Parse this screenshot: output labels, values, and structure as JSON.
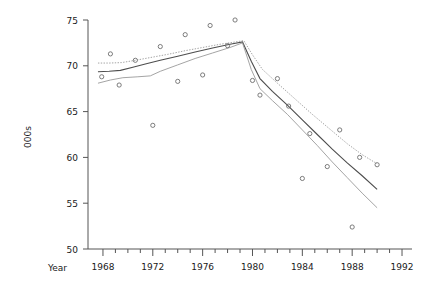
{
  "chart_data": {
    "type": "scatter",
    "title": "",
    "xlabel": "Year",
    "ylabel": "000s",
    "xlim": [
      1966.8,
      1992.8
    ],
    "ylim": [
      50,
      75
    ],
    "grid": false,
    "legend": "none",
    "x_ticks_major": [
      1968,
      1972,
      1976,
      1980,
      1984,
      1988,
      1992
    ],
    "x_tick_labels": [
      "1968",
      "1972",
      "1976",
      "1980",
      "1984",
      "1988",
      "1992"
    ],
    "x_ticks_minor": [
      1969,
      1970,
      1971,
      1973,
      1974,
      1975,
      1977,
      1978,
      1979,
      1981,
      1982,
      1983,
      1985,
      1986,
      1987,
      1989,
      1990,
      1991
    ],
    "y_ticks": [
      50,
      55,
      60,
      65,
      70,
      75
    ],
    "y_tick_labels": [
      "50",
      "55",
      "60",
      "65",
      "70",
      "75"
    ],
    "points": [
      {
        "x": 1967.9,
        "y": 68.8
      },
      {
        "x": 1968.6,
        "y": 71.3
      },
      {
        "x": 1969.3,
        "y": 67.9
      },
      {
        "x": 1970.6,
        "y": 70.6
      },
      {
        "x": 1972.0,
        "y": 63.5
      },
      {
        "x": 1972.6,
        "y": 72.1
      },
      {
        "x": 1974.0,
        "y": 68.3
      },
      {
        "x": 1974.6,
        "y": 73.4
      },
      {
        "x": 1976.0,
        "y": 69.0
      },
      {
        "x": 1976.6,
        "y": 74.4
      },
      {
        "x": 1978.0,
        "y": 72.2
      },
      {
        "x": 1978.6,
        "y": 75.0
      },
      {
        "x": 1980.0,
        "y": 68.4
      },
      {
        "x": 1980.6,
        "y": 66.8
      },
      {
        "x": 1982.0,
        "y": 68.6
      },
      {
        "x": 1982.9,
        "y": 65.6
      },
      {
        "x": 1984.0,
        "y": 57.7
      },
      {
        "x": 1984.6,
        "y": 62.6
      },
      {
        "x": 1986.0,
        "y": 59.0
      },
      {
        "x": 1987.0,
        "y": 63.0
      },
      {
        "x": 1988.0,
        "y": 52.4
      },
      {
        "x": 1988.6,
        "y": 60.0
      },
      {
        "x": 1990.0,
        "y": 59.2
      }
    ],
    "series": [
      {
        "name": "fit",
        "style": "solid-dark",
        "points": [
          {
            "x": 1967.6,
            "y": 69.35
          },
          {
            "x": 1968.5,
            "y": 69.4
          },
          {
            "x": 1969.4,
            "y": 69.5
          },
          {
            "x": 1970.4,
            "y": 69.85
          },
          {
            "x": 1971.4,
            "y": 70.2
          },
          {
            "x": 1972.6,
            "y": 70.6
          },
          {
            "x": 1974.0,
            "y": 71.05
          },
          {
            "x": 1975.4,
            "y": 71.5
          },
          {
            "x": 1976.8,
            "y": 71.95
          },
          {
            "x": 1978.2,
            "y": 72.35
          },
          {
            "x": 1979.2,
            "y": 72.6
          },
          {
            "x": 1979.9,
            "y": 70.5
          },
          {
            "x": 1980.6,
            "y": 68.6
          },
          {
            "x": 1981.6,
            "y": 67.2
          },
          {
            "x": 1982.8,
            "y": 65.7
          },
          {
            "x": 1984.0,
            "y": 64.1
          },
          {
            "x": 1985.2,
            "y": 62.5
          },
          {
            "x": 1986.4,
            "y": 60.9
          },
          {
            "x": 1987.6,
            "y": 59.4
          },
          {
            "x": 1988.8,
            "y": 58.0
          },
          {
            "x": 1990.0,
            "y": 56.5
          }
        ]
      },
      {
        "name": "upper-band",
        "style": "dotted",
        "points": [
          {
            "x": 1967.6,
            "y": 70.3
          },
          {
            "x": 1968.5,
            "y": 70.3
          },
          {
            "x": 1969.5,
            "y": 70.35
          },
          {
            "x": 1970.6,
            "y": 70.6
          },
          {
            "x": 1971.8,
            "y": 70.9
          },
          {
            "x": 1973.2,
            "y": 71.25
          },
          {
            "x": 1974.6,
            "y": 71.65
          },
          {
            "x": 1976.0,
            "y": 72.0
          },
          {
            "x": 1977.4,
            "y": 72.35
          },
          {
            "x": 1978.6,
            "y": 72.6
          },
          {
            "x": 1979.3,
            "y": 72.75
          },
          {
            "x": 1980.0,
            "y": 71.2
          },
          {
            "x": 1980.8,
            "y": 69.6
          },
          {
            "x": 1982.0,
            "y": 68.1
          },
          {
            "x": 1983.4,
            "y": 66.4
          },
          {
            "x": 1984.8,
            "y": 64.7
          },
          {
            "x": 1986.2,
            "y": 63.1
          },
          {
            "x": 1987.6,
            "y": 61.5
          },
          {
            "x": 1988.8,
            "y": 60.3
          },
          {
            "x": 1990.0,
            "y": 59.3
          }
        ]
      },
      {
        "name": "lower-band",
        "style": "solid-light",
        "points": [
          {
            "x": 1967.6,
            "y": 68.1
          },
          {
            "x": 1968.6,
            "y": 68.45
          },
          {
            "x": 1969.6,
            "y": 68.7
          },
          {
            "x": 1970.8,
            "y": 68.8
          },
          {
            "x": 1971.8,
            "y": 68.9
          },
          {
            "x": 1972.6,
            "y": 69.4
          },
          {
            "x": 1974.0,
            "y": 70.1
          },
          {
            "x": 1975.4,
            "y": 70.8
          },
          {
            "x": 1976.8,
            "y": 71.4
          },
          {
            "x": 1978.2,
            "y": 72.0
          },
          {
            "x": 1979.2,
            "y": 72.5
          },
          {
            "x": 1979.9,
            "y": 69.6
          },
          {
            "x": 1980.6,
            "y": 67.5
          },
          {
            "x": 1981.6,
            "y": 66.2
          },
          {
            "x": 1982.8,
            "y": 64.7
          },
          {
            "x": 1984.0,
            "y": 63.0
          },
          {
            "x": 1985.2,
            "y": 61.3
          },
          {
            "x": 1986.4,
            "y": 59.5
          },
          {
            "x": 1987.6,
            "y": 57.8
          },
          {
            "x": 1988.8,
            "y": 56.1
          },
          {
            "x": 1990.0,
            "y": 54.5
          }
        ]
      }
    ]
  }
}
